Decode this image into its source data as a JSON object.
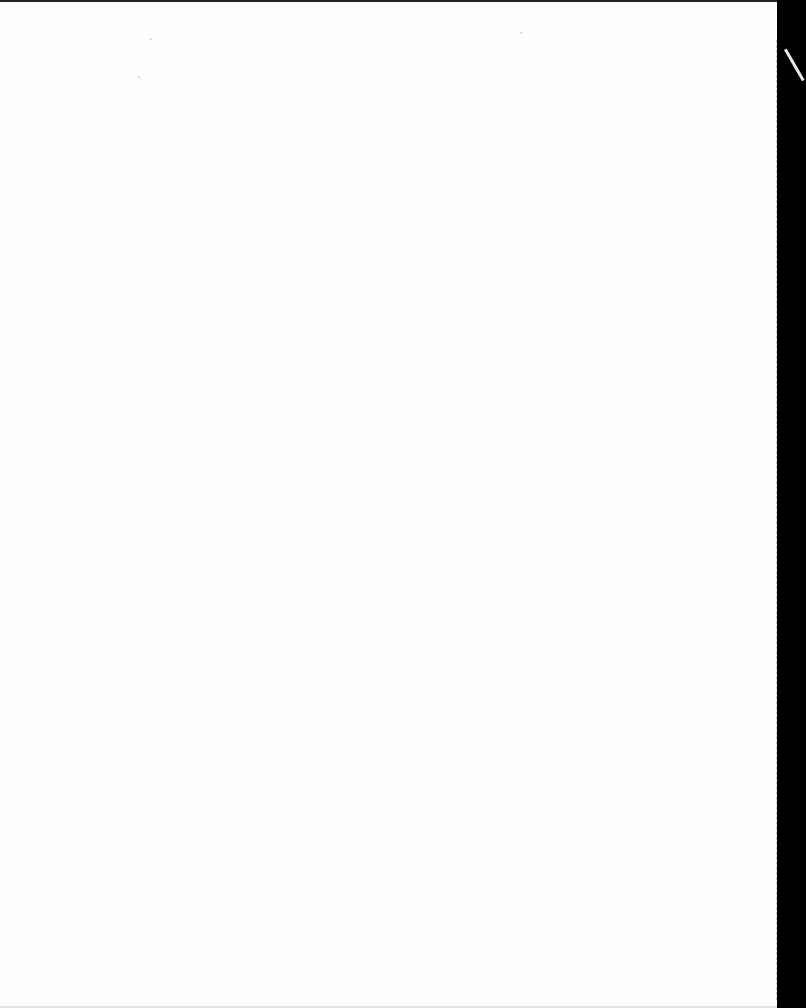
{
  "page": {
    "type": "blank-scanned-page",
    "background_color": "#fdfdfd",
    "border_color": "#000000"
  }
}
